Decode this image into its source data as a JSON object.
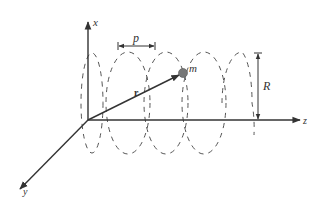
{
  "diagram": {
    "type": "helical-trajectory",
    "axes": {
      "x_label": "x",
      "y_label": "y",
      "z_label": "z"
    },
    "labels": {
      "pitch": "p",
      "radius": "R",
      "mass": "m",
      "position_vector": "r"
    },
    "colors": {
      "line": "#333333",
      "dashed": "#555555",
      "mass_fill": "#777777"
    }
  }
}
